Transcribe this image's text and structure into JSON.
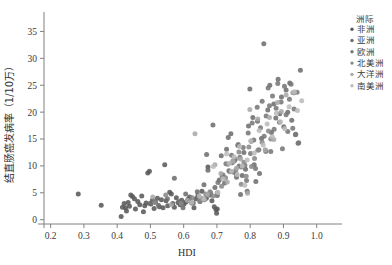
{
  "chart_data": {
    "type": "scatter",
    "title": "",
    "xlabel": "HDI",
    "ylabel": "结直肠癌发病率（1/10万）",
    "xlim": [
      0.18,
      1.04
    ],
    "ylim": [
      -0.8,
      37.5
    ],
    "xticks": [
      "0.2",
      "0.3",
      "0.4",
      "0.5",
      "0.6",
      "0.7",
      "0.8",
      "0.9",
      "1.0"
    ],
    "xtick_values": [
      0.2,
      0.3,
      0.4,
      0.5,
      0.6,
      0.7,
      0.8,
      0.9,
      1.0
    ],
    "yticks": [
      "0",
      "5",
      "10",
      "15",
      "20",
      "25",
      "30",
      "35"
    ],
    "ytick_values": [
      0,
      5,
      10,
      15,
      20,
      25,
      30,
      35
    ],
    "grid": false,
    "legend_position": "right-top",
    "legend_title": "洲际",
    "series": [
      {
        "name": "非洲",
        "color": "#5a5a5a",
        "points": [
          [
            0.283,
            4.8
          ],
          [
            0.352,
            2.7
          ],
          [
            0.412,
            0.6
          ],
          [
            0.416,
            2.3
          ],
          [
            0.421,
            3.0
          ],
          [
            0.425,
            2.2
          ],
          [
            0.428,
            1.6
          ],
          [
            0.433,
            3.2
          ],
          [
            0.437,
            2.5
          ],
          [
            0.441,
            4.6
          ],
          [
            0.446,
            4.3
          ],
          [
            0.452,
            3.9
          ],
          [
            0.455,
            2.0
          ],
          [
            0.462,
            3.4
          ],
          [
            0.468,
            2.8
          ],
          [
            0.474,
            4.4
          ],
          [
            0.479,
            1.5
          ],
          [
            0.483,
            2.6
          ],
          [
            0.487,
            3.1
          ],
          [
            0.492,
            8.7
          ],
          [
            0.497,
            9.0
          ],
          [
            0.501,
            2.9
          ],
          [
            0.506,
            3.6
          ],
          [
            0.511,
            2.1
          ],
          [
            0.515,
            3.3
          ],
          [
            0.521,
            4.0
          ],
          [
            0.527,
            2.4
          ],
          [
            0.533,
            3.7
          ],
          [
            0.538,
            2.2
          ],
          [
            0.543,
            10.2
          ],
          [
            0.547,
            3.5
          ],
          [
            0.552,
            2.6
          ],
          [
            0.558,
            5.1
          ],
          [
            0.563,
            4.8
          ],
          [
            0.567,
            3.0
          ],
          [
            0.572,
            2.3
          ],
          [
            0.578,
            4.1
          ],
          [
            0.583,
            3.2
          ],
          [
            0.589,
            2.8
          ],
          [
            0.594,
            3.6
          ],
          [
            0.601,
            2.9
          ],
          [
            0.607,
            3.3
          ],
          [
            0.613,
            3.8
          ],
          [
            0.618,
            4.2
          ],
          [
            0.624,
            3.1
          ],
          [
            0.631,
            2.2
          ],
          [
            0.637,
            3.9
          ],
          [
            0.643,
            4.5
          ],
          [
            0.649,
            3.4
          ],
          [
            0.655,
            5.3
          ],
          [
            0.662,
            3.7
          ],
          [
            0.668,
            4.0
          ],
          [
            0.673,
            9.8
          ],
          [
            0.679,
            4.6
          ],
          [
            0.685,
            3.5
          ],
          [
            0.692,
            2.4
          ],
          [
            0.697,
            1.9
          ],
          [
            0.699,
            1.2
          ],
          [
            0.701,
            2.0
          ]
        ]
      },
      {
        "name": "亚洲",
        "color": "#6e6e6e",
        "points": [
          [
            0.498,
            3.0
          ],
          [
            0.524,
            2.7
          ],
          [
            0.551,
            3.9
          ],
          [
            0.572,
            7.7
          ],
          [
            0.588,
            3.4
          ],
          [
            0.598,
            2.2
          ],
          [
            0.606,
            4.8
          ],
          [
            0.617,
            3.6
          ],
          [
            0.629,
            3.1
          ],
          [
            0.641,
            5.2
          ],
          [
            0.652,
            4.0
          ],
          [
            0.661,
            6.5
          ],
          [
            0.669,
            12.1
          ],
          [
            0.673,
            9.2
          ],
          [
            0.681,
            5.0
          ],
          [
            0.688,
            17.6
          ],
          [
            0.694,
            6.0
          ],
          [
            0.701,
            4.5
          ],
          [
            0.707,
            7.4
          ],
          [
            0.713,
            11.9
          ],
          [
            0.718,
            8.3
          ],
          [
            0.723,
            6.8
          ],
          [
            0.729,
            13.1
          ],
          [
            0.734,
            15.3
          ],
          [
            0.738,
            9.0
          ],
          [
            0.742,
            16.0
          ],
          [
            0.746,
            10.6
          ],
          [
            0.751,
            8.8
          ],
          [
            0.755,
            11.2
          ],
          [
            0.759,
            7.9
          ],
          [
            0.763,
            13.8
          ],
          [
            0.767,
            10.0
          ],
          [
            0.771,
            4.7
          ],
          [
            0.776,
            8.2
          ],
          [
            0.781,
            12.5
          ],
          [
            0.786,
            9.4
          ],
          [
            0.791,
            5.3
          ],
          [
            0.795,
            17.4
          ],
          [
            0.799,
            24.3
          ],
          [
            0.803,
            14.6
          ],
          [
            0.808,
            19.0
          ],
          [
            0.812,
            10.2
          ],
          [
            0.817,
            7.1
          ],
          [
            0.822,
            18.3
          ],
          [
            0.828,
            8.6
          ],
          [
            0.834,
            15.1
          ],
          [
            0.841,
            32.7
          ],
          [
            0.847,
            12.8
          ],
          [
            0.853,
            20.4
          ],
          [
            0.859,
            25.0
          ],
          [
            0.864,
            16.2
          ],
          [
            0.871,
            21.5
          ],
          [
            0.877,
            18.9
          ],
          [
            0.884,
            26.1
          ],
          [
            0.889,
            19.7
          ],
          [
            0.894,
            22.8
          ],
          [
            0.901,
            17.3
          ],
          [
            0.908,
            24.1
          ],
          [
            0.913,
            20.0
          ],
          [
            0.919,
            25.4
          ],
          [
            0.925,
            18.5
          ],
          [
            0.931,
            23.6
          ],
          [
            0.937,
            15.9
          ],
          [
            0.944,
            14.2
          ],
          [
            0.951,
            27.8
          ]
        ]
      },
      {
        "name": "欧洲",
        "color": "#787878",
        "points": [
          [
            0.703,
            6.9
          ],
          [
            0.716,
            8.0
          ],
          [
            0.727,
            10.4
          ],
          [
            0.736,
            9.1
          ],
          [
            0.744,
            12.0
          ],
          [
            0.752,
            10.9
          ],
          [
            0.758,
            8.5
          ],
          [
            0.764,
            14.0
          ],
          [
            0.769,
            11.6
          ],
          [
            0.774,
            9.8
          ],
          [
            0.779,
            13.4
          ],
          [
            0.784,
            10.1
          ],
          [
            0.789,
            7.3
          ],
          [
            0.794,
            16.1
          ],
          [
            0.801,
            12.3
          ],
          [
            0.806,
            18.0
          ],
          [
            0.811,
            14.8
          ],
          [
            0.816,
            9.5
          ],
          [
            0.821,
            20.9
          ],
          [
            0.826,
            13.0
          ],
          [
            0.831,
            17.1
          ],
          [
            0.836,
            22.0
          ],
          [
            0.842,
            15.5
          ],
          [
            0.848,
            19.3
          ],
          [
            0.854,
            24.5
          ],
          [
            0.858,
            21.2
          ],
          [
            0.862,
            12.7
          ],
          [
            0.867,
            23.0
          ],
          [
            0.872,
            16.8
          ],
          [
            0.878,
            20.7
          ],
          [
            0.883,
            25.3
          ],
          [
            0.888,
            18.1
          ],
          [
            0.893,
            21.9
          ],
          [
            0.897,
            13.2
          ],
          [
            0.903,
            24.8
          ],
          [
            0.908,
            19.5
          ],
          [
            0.913,
            16.4
          ],
          [
            0.918,
            22.4
          ],
          [
            0.923,
            25.2
          ],
          [
            0.928,
            17.0
          ],
          [
            0.932,
            20.6
          ],
          [
            0.936,
            15.8
          ],
          [
            0.941,
            23.7
          ],
          [
            0.946,
            14.3
          ]
        ]
      },
      {
        "name": "北美洲",
        "color": "#8a8a8a",
        "points": [
          [
            0.513,
            3.2
          ],
          [
            0.546,
            4.6
          ],
          [
            0.592,
            3.0
          ],
          [
            0.626,
            4.1
          ],
          [
            0.648,
            3.5
          ],
          [
            0.666,
            4.8
          ],
          [
            0.679,
            5.2
          ],
          [
            0.689,
            4.4
          ],
          [
            0.701,
            5.0
          ],
          [
            0.714,
            6.2
          ],
          [
            0.726,
            7.8
          ],
          [
            0.733,
            10.3
          ],
          [
            0.741,
            8.9
          ],
          [
            0.749,
            11.0
          ],
          [
            0.757,
            9.3
          ],
          [
            0.766,
            12.6
          ],
          [
            0.773,
            6.6
          ],
          [
            0.781,
            10.7
          ],
          [
            0.788,
            8.1
          ],
          [
            0.796,
            13.5
          ],
          [
            0.804,
            9.9
          ],
          [
            0.813,
            11.4
          ],
          [
            0.823,
            12.9
          ],
          [
            0.836,
            14.4
          ],
          [
            0.847,
            12.7
          ],
          [
            0.855,
            16.5
          ],
          [
            0.862,
            15.0
          ]
        ]
      },
      {
        "name": "大洋洲",
        "color": "#a8a8a8",
        "points": [
          [
            0.507,
            4.2
          ],
          [
            0.563,
            2.8
          ],
          [
            0.611,
            3.6
          ],
          [
            0.634,
            16.0
          ],
          [
            0.658,
            3.9
          ],
          [
            0.672,
            4.7
          ],
          [
            0.694,
            10.2
          ],
          [
            0.712,
            8.6
          ],
          [
            0.731,
            7.0
          ],
          [
            0.748,
            10.8
          ],
          [
            0.759,
            9.6
          ],
          [
            0.771,
            11.3
          ],
          [
            0.792,
            4.9
          ],
          [
            0.799,
            20.5
          ],
          [
            0.823,
            18.7
          ],
          [
            0.845,
            13.0
          ],
          [
            0.858,
            19.0
          ],
          [
            0.871,
            14.9
          ],
          [
            0.882,
            21.8
          ],
          [
            0.894,
            20.1
          ],
          [
            0.908,
            23.2
          ],
          [
            0.928,
            23.6
          ]
        ]
      },
      {
        "name": "南美洲",
        "color": "#bcbcbc",
        "points": [
          [
            0.624,
            3.2
          ],
          [
            0.647,
            4.4
          ],
          [
            0.662,
            3.8
          ],
          [
            0.689,
            9.9
          ],
          [
            0.703,
            5.1
          ],
          [
            0.718,
            7.6
          ],
          [
            0.729,
            12.2
          ],
          [
            0.737,
            10.5
          ],
          [
            0.744,
            9.0
          ],
          [
            0.752,
            11.7
          ],
          [
            0.761,
            8.4
          ],
          [
            0.768,
            13.6
          ],
          [
            0.776,
            10.0
          ],
          [
            0.784,
            6.4
          ],
          [
            0.791,
            11.1
          ],
          [
            0.802,
            14.7
          ],
          [
            0.812,
            12.4
          ],
          [
            0.827,
            16.6
          ],
          [
            0.839,
            13.9
          ],
          [
            0.851,
            17.8
          ],
          [
            0.866,
            15.4
          ],
          [
            0.879,
            19.8
          ],
          [
            0.891,
            18.2
          ],
          [
            0.904,
            16.9
          ],
          [
            0.917,
            21.0
          ],
          [
            0.933,
            23.8
          ],
          [
            0.942,
            20.3
          ],
          [
            0.955,
            22.1
          ]
        ]
      }
    ]
  }
}
